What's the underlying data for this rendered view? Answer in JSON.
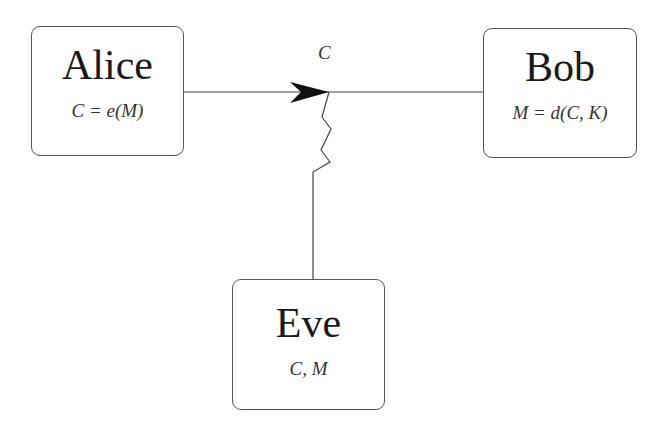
{
  "diagram": {
    "nodes": [
      {
        "id": "alice",
        "name": "Alice",
        "formula": "C = e(M)"
      },
      {
        "id": "bob",
        "name": "Bob",
        "formula": "M = d(C, K)"
      },
      {
        "id": "eve",
        "name": "Eve",
        "formula": "C, M"
      }
    ],
    "edges": [
      {
        "from": "alice",
        "to": "bob",
        "label": "C",
        "style": "arrow"
      },
      {
        "from": "eve",
        "to": "alice-bob-channel",
        "label": "",
        "style": "zigzag-tap"
      }
    ],
    "colors": {
      "stroke": "#555555",
      "text": "#1a1a1a",
      "background": "#ffffff"
    }
  }
}
